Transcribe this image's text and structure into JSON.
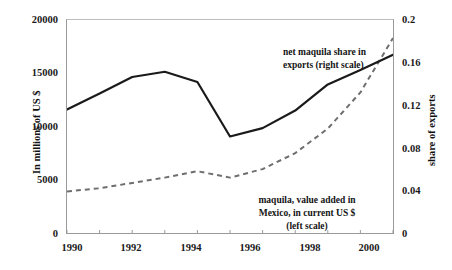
{
  "chart_data": {
    "type": "line",
    "title": "",
    "xlabel": "",
    "ylabel": "In millions of US $",
    "y2label": "share of exports",
    "x": [
      1990,
      1991,
      1992,
      1993,
      1994,
      1995,
      1996,
      1997,
      1998,
      1999,
      2000
    ],
    "xlim": [
      1990,
      2000
    ],
    "xticks": [
      "1990",
      "1992",
      "1994",
      "1996",
      "1998",
      "2000"
    ],
    "xtick_values": [
      1990,
      1992,
      1994,
      1996,
      1998,
      2000
    ],
    "xminor_values": [
      1991,
      1993,
      1995,
      1997,
      1999
    ],
    "ylim": [
      0,
      20000
    ],
    "yticks": [
      "0",
      "5000",
      "10000",
      "15000",
      "20000"
    ],
    "ytick_values": [
      0,
      5000,
      10000,
      15000,
      20000
    ],
    "y2lim": [
      0,
      0.2
    ],
    "y2ticks": [
      "0",
      "0.04",
      "0.08",
      "0.12",
      "0.16",
      "0.2"
    ],
    "y2tick_values": [
      0,
      0.04,
      0.08,
      0.12,
      0.16,
      0.2
    ],
    "grid": false,
    "legend": "in-plot annotations",
    "series": [
      {
        "name": "maquila, value added in Mexico, in current US $",
        "axis": "left",
        "style": "solid",
        "color": "#1a1a1a",
        "values": [
          11590,
          13100,
          14650,
          15140,
          14180,
          9065,
          9850,
          11500,
          13950,
          15300,
          16730
        ]
      },
      {
        "name": "net maquila share in exports",
        "axis": "right",
        "style": "dashed",
        "color": "#6e6e6e",
        "values": [
          0.039,
          0.042,
          0.047,
          0.052,
          0.058,
          0.052,
          0.06,
          0.075,
          0.098,
          0.132,
          0.183
        ]
      }
    ],
    "annotations": [
      {
        "id": "upper",
        "lines": [
          "net maquila share in",
          "exports (right scale)"
        ],
        "target_series": "net maquila share in exports"
      },
      {
        "id": "lower",
        "lines": [
          "maquila, value added in",
          "Mexico, in current US $",
          "(left scale)"
        ],
        "target_series": "maquila, value added in Mexico, in current US $"
      }
    ]
  },
  "axes": {
    "left_ticks": [
      "20000",
      "15000",
      "10000",
      "5000",
      "0"
    ],
    "right_ticks": [
      "0.2",
      "0.16",
      "0.12",
      "0.08",
      "0.04",
      "0"
    ],
    "bottom_ticks": [
      "1990",
      "1992",
      "1994",
      "1996",
      "1998",
      "2000"
    ],
    "left_title": "In millions of US $",
    "right_title": "share of exports"
  },
  "annotations": {
    "upper_line1": "net maquila share in",
    "upper_line2": "exports (right scale)",
    "lower_line1": "maquila, value added in",
    "lower_line2": "Mexico, in current US $",
    "lower_line3": "(left scale)"
  },
  "colors": {
    "solid_series": "#1a1a1a",
    "dashed_series": "#6e6e6e",
    "axis": "#9a9a9a",
    "text": "#111111",
    "background": "#ffffff"
  }
}
